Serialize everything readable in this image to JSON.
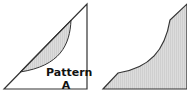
{
  "left_panel": {
    "label_line1": "Pattern",
    "label_line2": "A"
  },
  "colors": {
    "stroke": "#333333",
    "fill": "#d8d8d8"
  }
}
